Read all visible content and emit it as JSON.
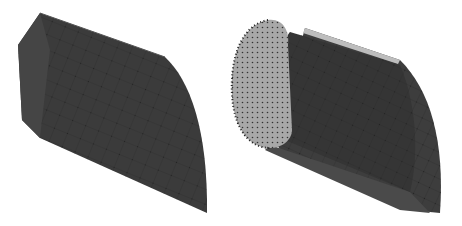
{
  "figure": {
    "panels": [
      {
        "id": "left",
        "description": "solid 3D mesh block (outer rock mass)",
        "fill": "#3c3c3c"
      },
      {
        "id": "right",
        "description": "3D mesh with tunnel cross-section exposed",
        "fill": "#3e3e3e",
        "face_fill": "#a8a8a8"
      }
    ],
    "colors": {
      "background": "#ffffff",
      "mesh_dark": "#3a3a3a",
      "mesh_line": "#262626",
      "face_light": "#a6a6a6",
      "top_strip": "#bdbdbd"
    }
  }
}
